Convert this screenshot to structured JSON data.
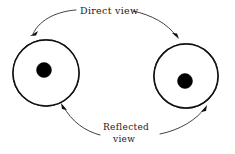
{
  "diagram": {
    "background_color": "#ffffff",
    "ink_color": "#111111",
    "labels": {
      "direct_view": "Direct view",
      "reflected_view_line1": "Reflected",
      "reflected_view_line2": "view"
    },
    "arcs": [
      {
        "name": "direct-view-arc",
        "label": "Direct view",
        "position": "top",
        "arrowheads": [
          "points-down-left-into-left-circle",
          "points-down-right-into-right-circle"
        ]
      },
      {
        "name": "reflected-view-arc",
        "label": "Reflected view",
        "position": "bottom",
        "arrowheads": [
          "points-up-left-into-left-circle",
          "points-up-right-into-right-circle"
        ]
      }
    ],
    "circles": [
      {
        "name": "left-circle",
        "center_x": 46,
        "center_y": 73,
        "radius": 33,
        "waterline_y": 75,
        "dot": {
          "cx": 44,
          "cy": 70,
          "r": 7.5,
          "color": "#000000"
        },
        "quadrants": {
          "upper_left": "blank",
          "upper_right": "stipple",
          "lower_left": "horizontal-lines",
          "lower_right": "dense-wave-hatch"
        }
      },
      {
        "name": "right-circle",
        "center_x": 186,
        "center_y": 76,
        "radius": 32,
        "waterline_y": 79,
        "dot": {
          "cx": 185,
          "cy": 81,
          "r": 7.5,
          "color": "#000000"
        },
        "quadrants": {
          "upper_left": "blank",
          "upper_right": "stipple",
          "lower_left": "horizontal-lines",
          "lower_right": "dense-wave-hatch"
        }
      }
    ]
  }
}
